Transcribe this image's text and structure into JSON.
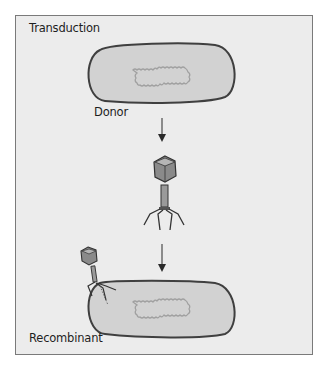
{
  "diagram": {
    "title": "Transduction",
    "labels": {
      "donor": "Donor",
      "recombinant": "Recombinant"
    },
    "colors": {
      "background": "#ececec",
      "frame_border": "#7a7a7a",
      "cell_fill": "#d2d2d2",
      "cell_outline": "#3f3f3f",
      "dna": "#a0a0a0",
      "phage_head": "#8a8a8a",
      "arrow": "#2a2a2a"
    },
    "nodes": [
      {
        "id": "donor-cell",
        "label": "Donor"
      },
      {
        "id": "bacteriophage",
        "label": ""
      },
      {
        "id": "recombinant-cell",
        "label": "Recombinant"
      }
    ],
    "edges": [
      {
        "from": "donor-cell",
        "to": "bacteriophage"
      },
      {
        "from": "bacteriophage",
        "to": "recombinant-cell"
      }
    ]
  }
}
